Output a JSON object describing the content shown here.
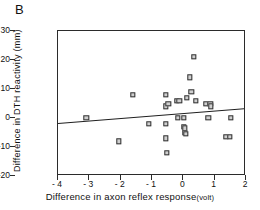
{
  "figure": {
    "panel_label": "B"
  },
  "chart_data": {
    "type": "scatter",
    "title": "B",
    "xlabel": "Difference in axon reflex response",
    "xlabel_unit": "(volt)",
    "ylabel": "Difference in DTH reactivity (mm)",
    "xlim": [
      -4,
      2
    ],
    "ylim": [
      -20,
      30
    ],
    "xticks": [
      -4,
      -3,
      -2,
      -1,
      0,
      1,
      2
    ],
    "xtick_labels": [
      "- 4",
      "- 3",
      "- 2",
      "- 1",
      "0",
      "1",
      "2"
    ],
    "yticks": [
      30,
      20,
      10,
      0,
      -10,
      -20
    ],
    "ytick_labels": [
      "30",
      "20",
      "10",
      "0",
      "-10",
      "-20"
    ],
    "grid": false,
    "legend": null,
    "marker": "open-square",
    "marker_color": "#cfcfcf",
    "marker_edge_color": "#333333",
    "line_color": "#1f1f1f",
    "points": [
      {
        "x": -3.1,
        "y": 0
      },
      {
        "x": -2.05,
        "y": -8
      },
      {
        "x": -1.62,
        "y": 8
      },
      {
        "x": -1.1,
        "y": -2
      },
      {
        "x": -0.55,
        "y": 8
      },
      {
        "x": -0.55,
        "y": 4
      },
      {
        "x": -0.55,
        "y": -2
      },
      {
        "x": -0.55,
        "y": -7
      },
      {
        "x": -0.52,
        "y": -12
      },
      {
        "x": -0.48,
        "y": 5
      },
      {
        "x": -0.2,
        "y": 6
      },
      {
        "x": -0.13,
        "y": 6
      },
      {
        "x": -0.18,
        "y": 0
      },
      {
        "x": 0.02,
        "y": 0
      },
      {
        "x": 0.02,
        "y": -3
      },
      {
        "x": 0.05,
        "y": -3.5
      },
      {
        "x": 0.04,
        "y": -5
      },
      {
        "x": 0.08,
        "y": -5.5
      },
      {
        "x": 0.12,
        "y": 7
      },
      {
        "x": 0.2,
        "y": 14
      },
      {
        "x": 0.26,
        "y": 9
      },
      {
        "x": 0.33,
        "y": 21
      },
      {
        "x": 0.4,
        "y": 6
      },
      {
        "x": 0.72,
        "y": 5
      },
      {
        "x": 0.8,
        "y": 0
      },
      {
        "x": 0.86,
        "y": 5
      },
      {
        "x": 0.88,
        "y": 4
      },
      {
        "x": 1.35,
        "y": -6.5
      },
      {
        "x": 1.48,
        "y": -6.5
      },
      {
        "x": 1.52,
        "y": 0
      }
    ],
    "fit_line": {
      "x0": -4,
      "y0": -1.8,
      "x1": 2,
      "y1": 3.3
    }
  }
}
